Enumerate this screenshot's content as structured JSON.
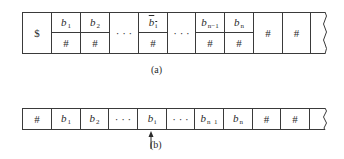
{
  "figure_a": {
    "caption": "(a)",
    "cells": [
      {
        "type": "single",
        "text": "$"
      },
      {
        "type": "split",
        "top_sym": "b",
        "top_sub": "1",
        "bottom": "#"
      },
      {
        "type": "split",
        "top_sym": "b",
        "top_sub": "2",
        "bottom": "#"
      },
      {
        "type": "ellipsis",
        "text": "· · ·"
      },
      {
        "type": "split",
        "top_sym": "b",
        "top_sub": "i",
        "top_overline": true,
        "bottom": "#"
      },
      {
        "type": "ellipsis",
        "text": "· · ·"
      },
      {
        "type": "split",
        "top_sym": "b",
        "top_sub": "n−1",
        "bottom": "#"
      },
      {
        "type": "split",
        "top_sym": "b",
        "top_sub": "n",
        "bottom": "#"
      },
      {
        "type": "single",
        "text": "#"
      },
      {
        "type": "single",
        "text": "#"
      },
      {
        "type": "open_end",
        "text": ""
      }
    ]
  },
  "figure_b": {
    "caption": "(b)",
    "cells": [
      {
        "text": "#"
      },
      {
        "sym": "b",
        "sub": "1"
      },
      {
        "sym": "b",
        "sub": "2"
      },
      {
        "text": "· · ·"
      },
      {
        "sym": "b",
        "sub": "i"
      },
      {
        "text": "· · ·"
      },
      {
        "sym": "b",
        "sub": "n  1"
      },
      {
        "sym": "b",
        "sub": "n"
      },
      {
        "text": "#"
      },
      {
        "text": "#"
      },
      {
        "text": ""
      }
    ],
    "head_pointer": {
      "under_cell_index": 4,
      "direction": "up"
    }
  }
}
